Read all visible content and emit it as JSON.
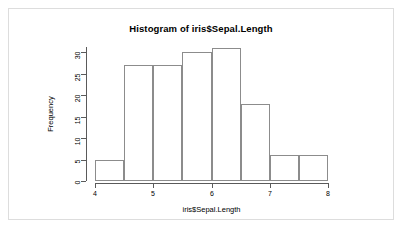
{
  "chart_data": {
    "type": "bar",
    "title": "Histogram of iris$Sepal.Length",
    "xlabel": "iris$Sepal.Length",
    "ylabel": "Frequency",
    "categories": [
      "4-4.5",
      "4.5-5",
      "5-5.5",
      "5.5-6",
      "6-6.5",
      "6.5-7",
      "7-7.5",
      "7.5-8"
    ],
    "bin_edges": [
      4.0,
      4.5,
      5.0,
      5.5,
      6.0,
      6.5,
      7.0,
      7.5,
      8.0
    ],
    "values": [
      5,
      27,
      27,
      30,
      31,
      18,
      6,
      6
    ],
    "xlim": [
      4,
      8
    ],
    "ylim": [
      0,
      31
    ],
    "x_ticks": [
      4,
      5,
      6,
      7,
      8
    ],
    "x_tick_labels": [
      "4",
      "5",
      "6",
      "7",
      "8"
    ],
    "y_ticks": [
      0,
      5,
      10,
      15,
      20,
      25,
      30
    ],
    "y_tick_labels": [
      "0",
      "5",
      "10",
      "15",
      "20",
      "25",
      "30"
    ],
    "grid": false,
    "legend": null,
    "bar_fill": "#ffffff",
    "bar_border": "#8c8c8c",
    "axis_color": "#5a5a5a",
    "text_color": "#000000",
    "background": "#ffffff",
    "frame_color": "#dddddd"
  }
}
